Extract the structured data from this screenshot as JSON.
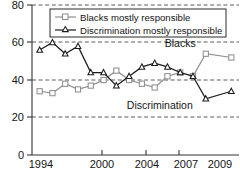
{
  "chart_data": {
    "type": "line",
    "title": "",
    "subtitle": "",
    "xlabel": "",
    "ylabel": "",
    "xlim": [
      1993.4,
      2009.6
    ],
    "ylim": [
      0,
      80
    ],
    "grid": true,
    "grid_axis": "y",
    "legend_position": "top-center",
    "x": [
      1994,
      1995,
      1996,
      1997,
      1998,
      1999,
      2000,
      2001,
      2002,
      2003,
      2004,
      2005,
      2006,
      2007,
      2009
    ],
    "xticks": [
      1994,
      2000,
      2004,
      2007,
      2009
    ],
    "xtick_labels": [
      "1994",
      "2000",
      "2004",
      "2007",
      "2009"
    ],
    "yticks": [
      0,
      20,
      40,
      60,
      80
    ],
    "ytick_labels": [
      "0",
      "20",
      "40",
      "60",
      "80"
    ],
    "series": [
      {
        "name": "Blacks mostly responsible",
        "color": "#8f8f8f",
        "marker": "square",
        "values": [
          34,
          33,
          38,
          35,
          37,
          40,
          45,
          40,
          38,
          36,
          42,
          44,
          42,
          54,
          52
        ]
      },
      {
        "name": "Discrimination mostly responsible",
        "color": "#1b1b1b",
        "marker": "triangle",
        "values": [
          56,
          60,
          54,
          58,
          44,
          44,
          37,
          42,
          47,
          49,
          47,
          44,
          42,
          30,
          34
        ]
      }
    ],
    "annotations": [
      {
        "text": "Blacks",
        "x": 2005.0,
        "y": 57.5
      },
      {
        "text": "Discrimination",
        "x": 2003.4,
        "y": 24.5
      }
    ],
    "legend": [
      {
        "label": "Blacks mostly responsible",
        "color": "#8f8f8f",
        "marker": "square"
      },
      {
        "label": "Discrimination mostly responsible",
        "color": "#1b1b1b",
        "marker": "triangle"
      }
    ]
  }
}
